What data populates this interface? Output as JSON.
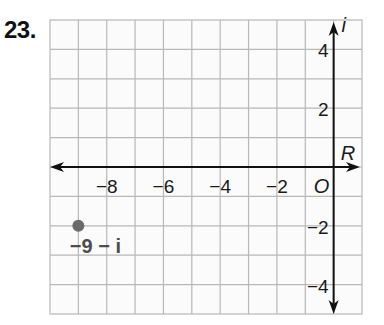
{
  "problem": {
    "number": "23."
  },
  "chart_data": {
    "type": "scatter",
    "title": "",
    "plane": "complex",
    "xlabel": "R",
    "ylabel": "i",
    "origin_label": "O",
    "xlim": [
      -10,
      1
    ],
    "ylim": [
      -5,
      5
    ],
    "grid": true,
    "x_tick_labels": [
      "−8",
      "−6",
      "−4",
      "−2"
    ],
    "x_tick_values": [
      -8,
      -6,
      -4,
      -2
    ],
    "y_tick_labels": [
      "4",
      "2",
      "−2",
      "−4"
    ],
    "y_tick_values": [
      4,
      2,
      -2,
      -4
    ],
    "points": [
      {
        "x": -9,
        "y": -2,
        "label": "−9 − i",
        "color": "#6b6b6b"
      }
    ]
  },
  "colors": {
    "grid": "#b8b8b8",
    "axis": "#111111",
    "point": "#6b6b6b",
    "point_label": "#4d4d4d"
  }
}
